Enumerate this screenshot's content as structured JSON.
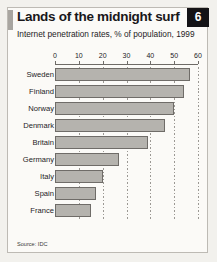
{
  "header": {
    "title": "Lands of the midnight surf",
    "subtitle": "Internet penetration rates, % of population, 1999",
    "badge": "6"
  },
  "footer": {
    "source": "Source: IDC"
  },
  "chart_data": {
    "type": "bar",
    "orientation": "horizontal",
    "title": "Lands of the midnight surf",
    "subtitle": "Internet penetration rates, % of population, 1999",
    "xlabel": "",
    "ylabel": "",
    "xlim": [
      0,
      60
    ],
    "xticks": [
      0,
      10,
      20,
      30,
      40,
      50,
      60
    ],
    "xtick_labels": [
      "0",
      "10",
      "20",
      "30",
      "40",
      "50",
      "60"
    ],
    "grid": true,
    "legend": false,
    "categories": [
      "Sweden",
      "Finland",
      "Norway",
      "Denmark",
      "Britain",
      "Germany",
      "Italy",
      "Spain",
      "France"
    ],
    "values": [
      56.5,
      54,
      50,
      46,
      39,
      27,
      20,
      17,
      15
    ],
    "units": "% of population",
    "colors": {
      "bar_fill": "#b5b3ae",
      "bar_border": "#6f6c68",
      "panel": "#fbfaf7",
      "badge_bg": "#141316",
      "badge_text": "#ffffff",
      "text": "#1d1b1e",
      "accent": "#a8a5a0"
    }
  }
}
